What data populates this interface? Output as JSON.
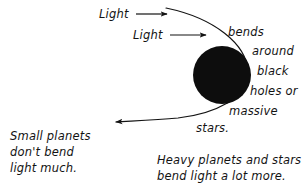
{
  "figure": {
    "type": "gravitational-lensing-diagram",
    "background_color": "#ffffff",
    "ink_color": "#131313",
    "mass_color": "#0d0d0d"
  },
  "beams": [
    {
      "id": "beam-1",
      "label": "Light"
    },
    {
      "id": "beam-2",
      "label": "Light"
    }
  ],
  "right_caption": {
    "lines": [
      "bends",
      "around",
      "black",
      "holes or",
      "massive",
      "stars."
    ]
  },
  "left_note": {
    "lines": [
      "Small planets",
      "don't bend",
      "light much."
    ]
  },
  "bottom_note": {
    "lines": [
      "Heavy planets and stars",
      "bend light a lot more."
    ]
  },
  "mass_body": {
    "name": "black hole",
    "shape": "filled-circle",
    "center_x": 222,
    "center_y": 75,
    "radius": 29
  }
}
